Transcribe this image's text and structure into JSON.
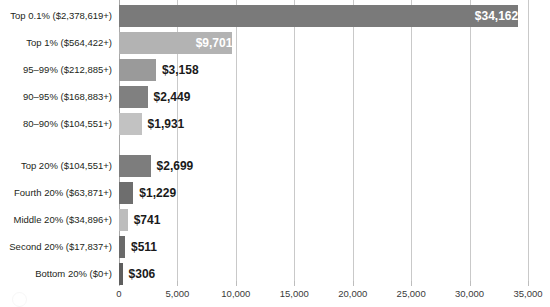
{
  "chart_data": {
    "type": "bar",
    "orientation": "horizontal",
    "title": "",
    "subtitle": "",
    "xlabel": "",
    "ylabel": "",
    "xlim": [
      0,
      35000
    ],
    "grid": true,
    "legend": "none",
    "xticks": [
      0,
      5000,
      10000,
      15000,
      20000,
      25000,
      30000,
      35000
    ],
    "xtick_labels": [
      "0",
      "5,000",
      "10,000",
      "15,000",
      "20,000",
      "25,000",
      "30,000",
      "35,000"
    ],
    "categories": [
      "Top 0.1% ($2,378,619+)",
      "Top 1% ($564,422+)",
      "95–99% ($212,885+)",
      "90–95% ($168,883+)",
      "80–90% ($104,551+)",
      "Top 20% ($104,551+)",
      "Fourth 20% ($63,871+)",
      "Middle 20% ($34,896+)",
      "Second 20% ($17,837+)",
      "Bottom 20% ($0+)"
    ],
    "values": [
      34162,
      9701,
      3158,
      2449,
      1931,
      2699,
      1229,
      741,
      511,
      306
    ],
    "value_labels": [
      "$34,162",
      "$9,701",
      "$3,158",
      "$2,449",
      "$1,931",
      "$2,699",
      "$1,229",
      "$741",
      "$511",
      "$306"
    ],
    "bar_colors": [
      "#7a7a7a",
      "#b3b3b3",
      "#9a9a9a",
      "#808080",
      "#c2c2c2",
      "#7d7d7d",
      "#6e6e6e",
      "#bdbdbd",
      "#6a6a6a",
      "#5e5e5e"
    ],
    "label_placement": [
      "inside",
      "inside",
      "outside",
      "outside",
      "outside",
      "outside",
      "outside",
      "outside",
      "outside",
      "outside"
    ],
    "group_gap_after_index": 4,
    "colors": {
      "gridline": "#c9c9c9",
      "axis": "#a8a8a8",
      "text": "#231f20",
      "inside_label": "#ffffff"
    }
  }
}
